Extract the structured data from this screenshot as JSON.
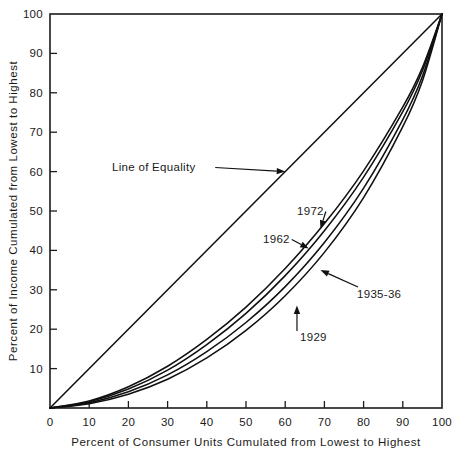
{
  "chart_data": {
    "type": "line",
    "title": "",
    "xlabel": "Percent of Consumer Units Cumulated from Lowest to Highest",
    "ylabel": "Percent of Income Cumulated from Lowest to Highest",
    "xlim": [
      0,
      100
    ],
    "ylim": [
      0,
      100
    ],
    "grid": false,
    "legend_position": "inline-annotations",
    "xticks": [
      "0",
      "10",
      "20",
      "30",
      "40",
      "50",
      "60",
      "70",
      "80",
      "90",
      "100"
    ],
    "yticks": [
      "10",
      "20",
      "30",
      "40",
      "50",
      "60",
      "70",
      "80",
      "90",
      "100"
    ],
    "x": [
      0,
      10,
      20,
      30,
      40,
      50,
      60,
      70,
      80,
      90,
      95,
      100
    ],
    "series": [
      {
        "name": "Line of Equality",
        "values": [
          0,
          10,
          20,
          30,
          40,
          50,
          60,
          70,
          80,
          90,
          95,
          100
        ]
      },
      {
        "name": "1972",
        "values": [
          0,
          1.8,
          5.4,
          10.6,
          17.4,
          25.6,
          35.4,
          46.8,
          60.2,
          76.4,
          86.4,
          100
        ]
      },
      {
        "name": "1962",
        "values": [
          0,
          1.6,
          4.8,
          9.6,
          16.1,
          24.0,
          33.6,
          45.0,
          58.6,
          75.2,
          85.6,
          100
        ]
      },
      {
        "name": "1935-36",
        "values": [
          0,
          1.3,
          4.1,
          8.4,
          14.3,
          21.7,
          30.8,
          42.0,
          55.8,
          73.2,
          84.2,
          100
        ]
      },
      {
        "name": "1929",
        "values": [
          0,
          1.1,
          3.5,
          7.3,
          12.7,
          19.7,
          28.5,
          39.5,
          53.4,
          71.4,
          83.0,
          100
        ]
      }
    ],
    "annotations": [
      {
        "label": "Line of Equality",
        "target_series": "Line of Equality",
        "target_x": 60,
        "target_y": 60
      },
      {
        "label": "1972",
        "target_series": "1972",
        "target_x": 69,
        "target_y": 45.5
      },
      {
        "label": "1962",
        "target_series": "1962",
        "target_x": 66,
        "target_y": 40.5
      },
      {
        "label": "1935-36",
        "target_series": "1935-36",
        "target_x": 69,
        "target_y": 35.0
      },
      {
        "label": "1929",
        "target_series": "1929",
        "target_x": 63,
        "target_y": 26.0
      }
    ]
  }
}
